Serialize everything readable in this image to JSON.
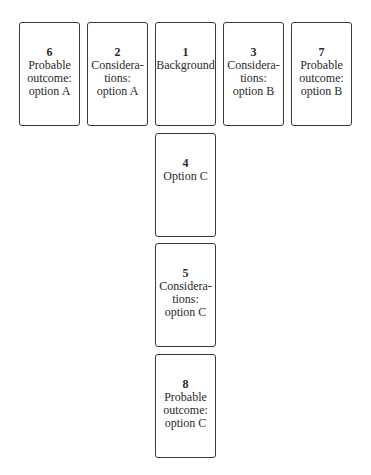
{
  "cards": [
    {
      "number": "6",
      "label": "Probable\noutcome:\noption A"
    },
    {
      "number": "2",
      "label": "Considera-\ntions:\noption A"
    },
    {
      "number": "1",
      "label": "Background"
    },
    {
      "number": "3",
      "label": "Considera-\ntions:\noption B"
    },
    {
      "number": "7",
      "label": "Probable\noutcome:\noption B"
    },
    {
      "number": "4",
      "label": "Option C"
    },
    {
      "number": "5",
      "label": "Considera-\ntions:\noption C"
    },
    {
      "number": "8",
      "label": "Probable\noutcome:\noption C"
    }
  ]
}
